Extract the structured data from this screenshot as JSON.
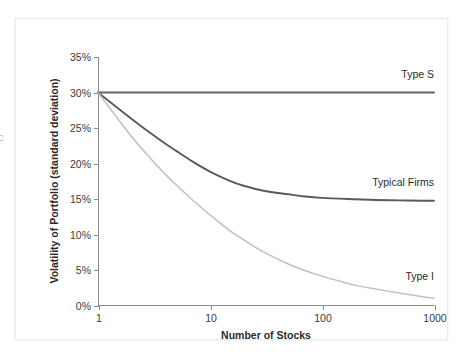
{
  "figure": {
    "edge_glyph": "c"
  },
  "chart_data": {
    "type": "line",
    "title": "",
    "xlabel": "Number of Stocks",
    "ylabel": "Volatility of Portfolio (standard deviation)",
    "xscale": "log",
    "xlim": [
      1,
      1000
    ],
    "ylim": [
      0,
      35
    ],
    "grid": false,
    "legend_position": "right-of-curve-ends",
    "xticks": [
      {
        "value": 1,
        "label": "1"
      },
      {
        "value": 10,
        "label": "10"
      },
      {
        "value": 100,
        "label": "100"
      },
      {
        "value": 1000,
        "label": "1000"
      }
    ],
    "yticks": [
      {
        "value": 0,
        "label": "0%"
      },
      {
        "value": 5,
        "label": "5%"
      },
      {
        "value": 10,
        "label": "10%"
      },
      {
        "value": 15,
        "label": "15%"
      },
      {
        "value": 20,
        "label": "20%"
      },
      {
        "value": 25,
        "label": "25%"
      },
      {
        "value": 30,
        "label": "30%"
      },
      {
        "value": 35,
        "label": "35%"
      }
    ],
    "series": [
      {
        "name": "Type S",
        "color": "#636363",
        "label_x": 1000,
        "label_y": 32.6,
        "x": [
          1,
          2,
          3,
          5,
          8,
          10,
          20,
          30,
          50,
          80,
          100,
          200,
          300,
          500,
          800,
          1000
        ],
        "values": [
          30.0,
          30.0,
          30.0,
          30.0,
          30.0,
          30.0,
          30.0,
          30.0,
          30.0,
          30.0,
          30.0,
          30.0,
          30.0,
          30.0,
          30.0,
          30.0
        ]
      },
      {
        "name": "Typical Firms",
        "color": "#5a5a5a",
        "label_x": 1000,
        "label_y": 17.5,
        "x": [
          1,
          2,
          3,
          4,
          5,
          7,
          10,
          15,
          20,
          30,
          50,
          70,
          100,
          200,
          300,
          500,
          800,
          1000
        ],
        "values": [
          30.0,
          26.3,
          24.2,
          22.8,
          21.8,
          20.3,
          18.9,
          17.6,
          16.9,
          16.2,
          15.7,
          15.4,
          15.2,
          15.0,
          14.9,
          14.85,
          14.8,
          14.8
        ]
      },
      {
        "name": "Type I",
        "color": "#c0c0c0",
        "label_x": 1000,
        "label_y": 4.2,
        "x": [
          1,
          2,
          3,
          4,
          5,
          7,
          10,
          15,
          20,
          30,
          50,
          70,
          100,
          150,
          200,
          300,
          500,
          800,
          1000
        ],
        "values": [
          30.0,
          23.8,
          20.6,
          18.5,
          17.0,
          14.9,
          12.8,
          10.6,
          9.3,
          7.6,
          5.9,
          5.0,
          4.2,
          3.4,
          2.9,
          2.4,
          1.8,
          1.3,
          1.1
        ]
      }
    ]
  }
}
